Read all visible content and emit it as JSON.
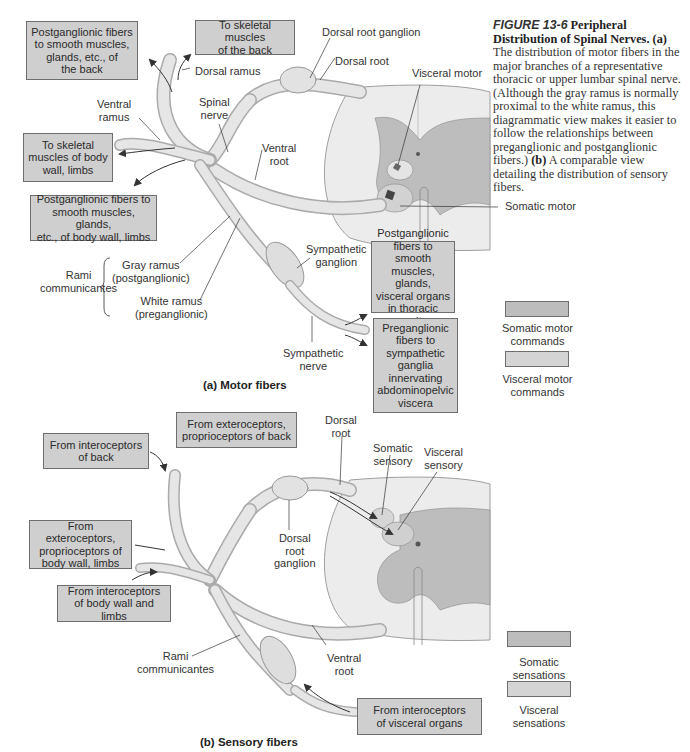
{
  "caption": {
    "figure_label": "FIGURE 13-6",
    "title": "Peripheral Distribution of Spinal Nerves.",
    "part_a_label": "(a)",
    "part_a_text": "The distribution of motor fibers in the major branches of a representative thoracic or upper lumbar spinal nerve. (Although the gray ramus is normally proximal to the white ramus, this diagrammatic view makes it easier to follow the relationships between preganglionic and postganglionic fibers.)",
    "part_b_label": "(b)",
    "part_b_text": "A comparable view detailing the distribution of sensory fibers."
  },
  "panel_a": {
    "title": "(a) Motor fibers",
    "boxes": {
      "postgang_back": "Postganglionic fibers\nto smooth muscles,\nglands, etc., of\nthe back",
      "skeletal_back": "To skeletal muscles\nof the back",
      "skeletal_body": "To skeletal\nmuscles of body\nwall, limbs",
      "postgang_body": "Postganglionic fibers to\nsmooth muscles, glands,\netc., of body wall, limbs",
      "postgang_thoracic": "Postganglionic\nfibers to smooth\nmuscles, glands,\nvisceral organs\nin thoracic cavity",
      "pregang_abdominal": "Preganglionic\nfibers to\nsympathetic\nganglia\ninnervating\nabdominopelvic\nviscera"
    },
    "labels": {
      "dorsal_root_ganglion": "Dorsal root ganglion",
      "dorsal_root": "Dorsal root",
      "visceral_motor": "Visceral motor",
      "dorsal_ramus": "Dorsal ramus",
      "ventral_ramus": "Ventral\nramus",
      "spinal_nerve": "Spinal\nnerve",
      "ventral_root": "Ventral\nroot",
      "somatic_motor": "Somatic motor",
      "rami_communicantes": "Rami\ncommunicantes",
      "gray_ramus": "Gray ramus\n(postganglionic)",
      "white_ramus": "White ramus\n(preganglionic)",
      "sympathetic_ganglion": "Sympathetic\nganglion",
      "sympathetic_nerve": "Sympathetic\nnerve"
    },
    "legend": [
      {
        "label": "Somatic motor\ncommands",
        "color": "#bdbdbd"
      },
      {
        "label": "Visceral motor\ncommands",
        "color": "#d4d4d4"
      }
    ]
  },
  "panel_b": {
    "title": "(b) Sensory fibers",
    "boxes": {
      "intero_back": "From interoceptors\nof back",
      "extero_back": "From exteroceptors,\nproprioceptors of back",
      "extero_body": "From exteroceptors,\nproprioceptors of\nbody wall, limbs",
      "intero_body": "From interoceptors\nof body wall and limbs",
      "intero_visceral": "From interoceptors\nof visceral organs"
    },
    "labels": {
      "dorsal_root": "Dorsal\nroot",
      "somatic_sensory": "Somatic\nsensory",
      "visceral_sensory": "Visceral\nsensory",
      "dorsal_root_ganglion": "Dorsal\nroot\nganglion",
      "rami_communicantes": "Rami\ncommunicantes",
      "ventral_root": "Ventral\nroot"
    },
    "legend": [
      {
        "label": "Somatic\nsensations",
        "color": "#bdbdbd"
      },
      {
        "label": "Visceral\nsensations",
        "color": "#d4d4d4"
      }
    ]
  }
}
